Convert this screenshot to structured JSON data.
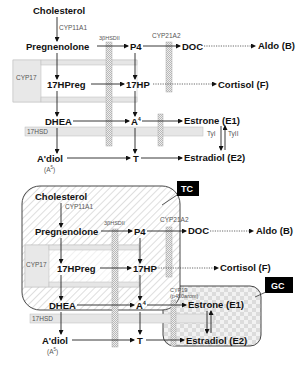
{
  "diagram": {
    "type": "steroidogenesis-pathway",
    "panels": [
      {
        "id": "top",
        "molecules": {
          "cholesterol": "Cholesterol",
          "pregnenolone": "Pregnenolone",
          "p4": "P4",
          "doc": "DOC",
          "aldo": "Aldo (B)",
          "hpreg": "17HPreg",
          "hp": "17HP",
          "cortisol": "Cortisol (F)",
          "dhea": "DHEA",
          "a4": "A",
          "a4_sup": "4",
          "estrone": "Estrone (E1)",
          "adiol": "A'diol",
          "adiol_sub": "(A",
          "adiol_sub_sup": "5",
          "adiol_sub_close": ")",
          "t": "T",
          "estradiol": "Estradiol (E2)"
        },
        "enzymes": {
          "cyp11a1": "CYP11A1",
          "hsd3b": "3βHSDII",
          "cyp21a2": "CYP21A2",
          "cyp17": "CYP17",
          "hsd17": "17HSD",
          "tyI": "TyI",
          "tyII": "TyII"
        }
      },
      {
        "id": "bottom",
        "molecules": {
          "cholesterol": "Cholesterol",
          "pregnenolone": "Pregnenolone",
          "p4": "P4",
          "doc": "DOC",
          "aldo": "Aldo (B)",
          "hpreg": "17HPreg",
          "hp": "17HP",
          "cortisol": "Cortisol (F)",
          "dhea": "DHEA",
          "a4": "A",
          "a4_sup": "4",
          "estrone": "Estrone (E1)",
          "adiol": "A'diol",
          "adiol_sub": "(A",
          "adiol_sub_sup": "5",
          "adiol_sub_close": ")",
          "t": "T",
          "estradiol": "Estradiol (E2)"
        },
        "enzymes": {
          "cyp11a1": "CYP11A1",
          "hsd3b": "3βHSDII",
          "cyp21a2": "CYP21A2",
          "cyp17": "CYP17",
          "hsd17": "17HSD",
          "cyp19": "CYP19",
          "cyp19_alt": "(p450arom)"
        },
        "compartments": {
          "tc": "TC",
          "gc": "GC"
        }
      }
    ],
    "colors": {
      "line": "#222222",
      "band": "#e6e6e6",
      "tag_bg": "#000000",
      "tag_text": "#ffffff"
    }
  }
}
